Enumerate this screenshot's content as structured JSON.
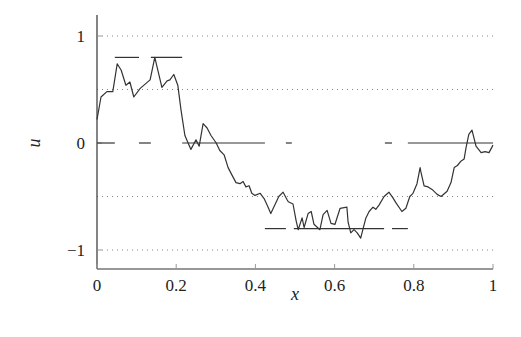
{
  "chart_data": {
    "type": "line",
    "title": "",
    "xlabel": "x",
    "ylabel": "u",
    "xlim": [
      0,
      1
    ],
    "ylim": [
      -1.2,
      1.2
    ],
    "x_ticks": [
      0,
      0.2,
      0.4,
      0.6,
      0.8,
      1
    ],
    "x_tick_labels": [
      "0",
      "0.2",
      "0.4",
      "0.6",
      "0.8",
      "1"
    ],
    "y_ticks": [
      -1,
      0,
      1
    ],
    "y_tick_labels": [
      "−1",
      "0",
      "1"
    ],
    "grid": {
      "horizontal_dotted_at": [
        1,
        0.5,
        -0.5,
        -1
      ]
    },
    "legend": null,
    "series": [
      {
        "name": "u(x) rough curve",
        "style": "solid",
        "color": "#333333",
        "x": [
          0.0,
          0.01,
          0.025,
          0.04,
          0.051,
          0.061,
          0.073,
          0.083,
          0.093,
          0.109,
          0.134,
          0.146,
          0.164,
          0.177,
          0.184,
          0.194,
          0.204,
          0.212,
          0.222,
          0.237,
          0.25,
          0.258,
          0.268,
          0.278,
          0.288,
          0.301,
          0.31,
          0.321,
          0.331,
          0.341,
          0.351,
          0.361,
          0.369,
          0.376,
          0.384,
          0.391,
          0.399,
          0.412,
          0.422,
          0.432,
          0.439,
          0.449,
          0.459,
          0.47,
          0.48,
          0.483,
          0.495,
          0.503,
          0.508,
          0.518,
          0.523,
          0.533,
          0.541,
          0.548,
          0.563,
          0.571,
          0.581,
          0.591,
          0.601,
          0.614,
          0.631,
          0.634,
          0.641,
          0.649,
          0.657,
          0.666,
          0.672,
          0.679,
          0.687,
          0.697,
          0.704,
          0.712,
          0.725,
          0.737,
          0.747,
          0.755,
          0.77,
          0.78,
          0.79,
          0.798,
          0.808,
          0.816,
          0.818,
          0.826,
          0.836,
          0.848,
          0.859,
          0.869,
          0.884,
          0.894,
          0.902,
          0.91,
          0.919,
          0.927,
          0.932,
          0.939,
          0.947,
          0.957,
          0.97,
          0.98,
          0.99,
          1.0
        ],
        "y": [
          0.22,
          0.43,
          0.48,
          0.48,
          0.74,
          0.68,
          0.54,
          0.57,
          0.43,
          0.51,
          0.59,
          0.8,
          0.52,
          0.58,
          0.59,
          0.64,
          0.54,
          0.31,
          0.07,
          -0.06,
          0.03,
          -0.03,
          0.18,
          0.14,
          0.07,
          0.0,
          -0.07,
          -0.11,
          -0.23,
          -0.3,
          -0.37,
          -0.38,
          -0.36,
          -0.41,
          -0.4,
          -0.47,
          -0.49,
          -0.47,
          -0.52,
          -0.6,
          -0.66,
          -0.58,
          -0.5,
          -0.46,
          -0.53,
          -0.55,
          -0.57,
          -0.73,
          -0.81,
          -0.7,
          -0.79,
          -0.66,
          -0.64,
          -0.76,
          -0.81,
          -0.67,
          -0.63,
          -0.75,
          -0.76,
          -0.61,
          -0.6,
          -0.74,
          -0.84,
          -0.81,
          -0.84,
          -0.89,
          -0.8,
          -0.7,
          -0.64,
          -0.6,
          -0.62,
          -0.58,
          -0.5,
          -0.46,
          -0.51,
          -0.56,
          -0.64,
          -0.61,
          -0.5,
          -0.47,
          -0.38,
          -0.23,
          -0.27,
          -0.4,
          -0.41,
          -0.44,
          -0.48,
          -0.5,
          -0.45,
          -0.37,
          -0.23,
          -0.21,
          -0.17,
          -0.15,
          -0.04,
          0.08,
          0.12,
          -0.03,
          -0.09,
          -0.08,
          -0.09,
          -0.02
        ]
      },
      {
        "name": "piecewise constant levels",
        "style": "solid-segments",
        "color": "#333333",
        "segments": [
          {
            "x0": 0.0,
            "x1": 0.045,
            "y": 0
          },
          {
            "x0": 0.045,
            "x1": 0.106,
            "y": 0.8
          },
          {
            "x0": 0.106,
            "x1": 0.136,
            "y": 0
          },
          {
            "x0": 0.136,
            "x1": 0.215,
            "y": 0.8
          },
          {
            "x0": 0.215,
            "x1": 0.424,
            "y": 0
          },
          {
            "x0": 0.424,
            "x1": 0.477,
            "y": -0.8
          },
          {
            "x0": 0.477,
            "x1": 0.492,
            "y": 0
          },
          {
            "x0": 0.497,
            "x1": 0.725,
            "y": -0.8
          },
          {
            "x0": 0.727,
            "x1": 0.745,
            "y": 0
          },
          {
            "x0": 0.745,
            "x1": 0.785,
            "y": -0.8
          },
          {
            "x0": 0.785,
            "x1": 1.0,
            "y": 0
          }
        ]
      }
    ],
    "layout": {
      "plot_left_px": 97,
      "plot_right_px": 493,
      "y1_px": 35,
      "y0_px": 143,
      "ym1_px": 249,
      "axis_bottom_px": 269,
      "axis_top_px": 15
    }
  }
}
